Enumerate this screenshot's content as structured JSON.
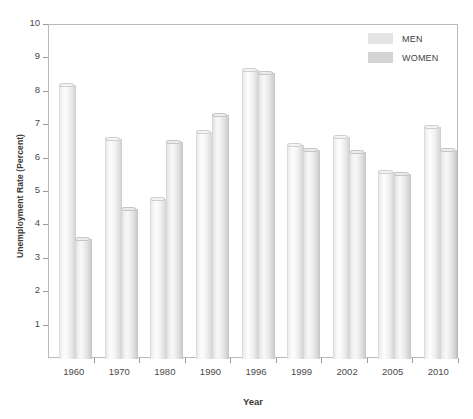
{
  "chart_data": {
    "type": "bar",
    "title": "",
    "xlabel": "Year",
    "ylabel": "Unemployment Rate (Percent)",
    "categories": [
      "1960",
      "1970",
      "1980",
      "1990",
      "1996",
      "1999",
      "2002",
      "2005",
      "2010"
    ],
    "series": [
      {
        "name": "MEN",
        "color": "#e4e4e4",
        "values": [
          8.2,
          6.6,
          4.8,
          6.8,
          8.65,
          6.4,
          6.65,
          5.6,
          6.95
        ]
      },
      {
        "name": "WOMEN",
        "color": "#d4d4d4",
        "values": [
          3.6,
          4.5,
          6.5,
          7.3,
          8.55,
          6.25,
          6.2,
          5.55,
          6.25
        ]
      }
    ],
    "ylim": [
      0,
      10
    ],
    "ytick_labels": [
      "10",
      "9",
      "8",
      "7",
      "6",
      "5",
      "4",
      "3",
      "2",
      "1"
    ],
    "ytick_values": [
      10,
      9,
      8,
      7,
      6,
      5,
      4,
      3,
      2,
      1
    ],
    "grid": false,
    "legend_position": "top-right"
  },
  "axes": {
    "y_title": "Unemployment Rate (Percent)",
    "x_title": "Year"
  },
  "legend": {
    "entries": [
      {
        "label": "MEN"
      },
      {
        "label": "WOMEN"
      }
    ]
  },
  "colors": {
    "frame": "#b9b9b9",
    "tick": "#9b9b9b",
    "text": "#4a4a4a",
    "title_text": "#3a3a3a",
    "men_fill": "#e4e4e4",
    "women_fill": "#d4d4d4",
    "background": "#ffffff"
  }
}
